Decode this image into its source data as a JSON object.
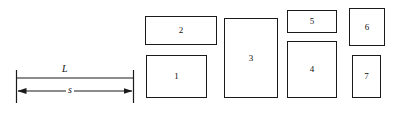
{
  "figure": {
    "name": "rectangle-packing-strip-diagram",
    "background_color": "#ffffff",
    "stroke_color": "#1a1a1a",
    "width": 401,
    "height": 114
  },
  "dimensions": {
    "length_label": "L",
    "span_label": "s",
    "extension_line_x_left": 16,
    "extension_line_x_right": 133,
    "length_line_y": 78,
    "span_line_y": 91,
    "extension_top": 70,
    "extension_bottom": 103
  },
  "boxes": [
    {
      "label": "1",
      "x": 146,
      "y": 55,
      "w": 61,
      "h": 43
    },
    {
      "label": "2",
      "x": 145,
      "y": 16,
      "w": 72,
      "h": 29
    },
    {
      "label": "3",
      "x": 224,
      "y": 18,
      "w": 54,
      "h": 80
    },
    {
      "label": "4",
      "x": 287,
      "y": 41,
      "w": 50,
      "h": 57
    },
    {
      "label": "5",
      "x": 287,
      "y": 10,
      "w": 50,
      "h": 23
    },
    {
      "label": "6",
      "x": 349,
      "y": 8,
      "w": 36,
      "h": 38
    },
    {
      "label": "7",
      "x": 352,
      "y": 55,
      "w": 29,
      "h": 43
    }
  ]
}
